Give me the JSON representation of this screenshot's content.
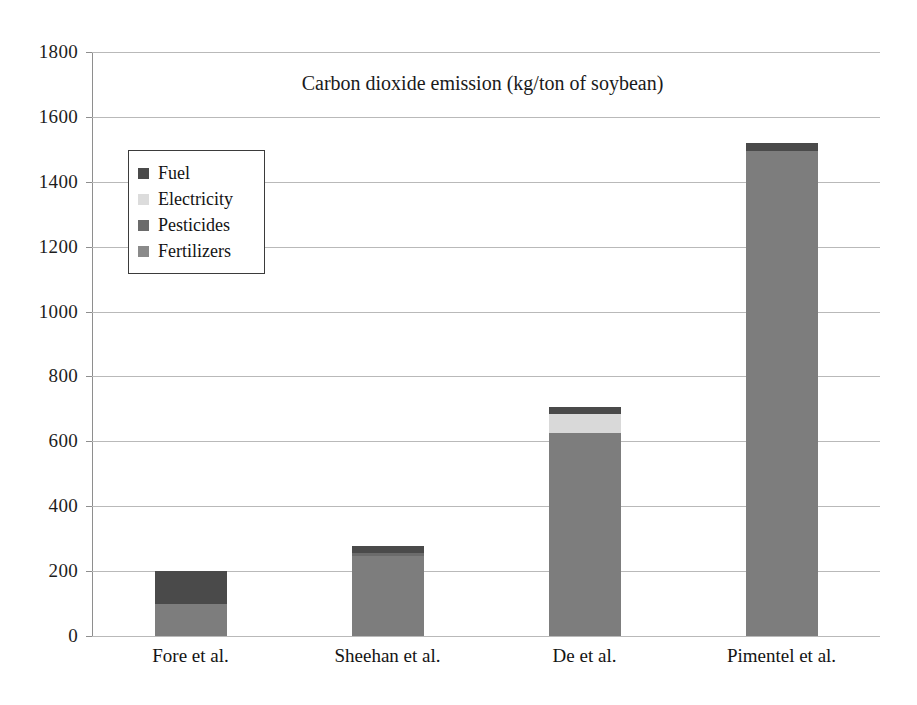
{
  "chart_data": {
    "type": "bar",
    "subtype": "stacked",
    "title": "Carbon dioxide emission (kg/ton of soybean)",
    "xlabel": "",
    "ylabel": "",
    "ylim": [
      0,
      1800
    ],
    "ytick_step": 200,
    "yticks": [
      1800,
      1600,
      1400,
      1200,
      1000,
      800,
      600,
      400,
      200,
      0
    ],
    "ytick_labels": [
      "1800",
      "1600",
      "1400",
      "1200",
      "1000",
      "800",
      "600",
      "400",
      "200",
      "0"
    ],
    "categories": [
      "Fore et al.",
      "Sheehan et al.",
      "De et al.",
      "Pimentel et al."
    ],
    "grid": true,
    "legend_position": "upper-left-inside",
    "series": [
      {
        "name": "Fertilizers",
        "color": "#7d7d7d",
        "values": [
          100,
          248,
          625,
          1495
        ]
      },
      {
        "name": "Pesticides",
        "color": "#6b6b6b",
        "values": [
          0,
          8,
          0,
          0
        ]
      },
      {
        "name": "Electricity",
        "color": "#d9d9d9",
        "values": [
          0,
          0,
          60,
          0
        ]
      },
      {
        "name": "Fuel",
        "color": "#4a4a4a",
        "values": [
          100,
          20,
          20,
          25
        ]
      }
    ],
    "totals": [
      200,
      276,
      705,
      1520
    ],
    "stack_order_bottom_to_top": [
      "Fertilizers",
      "Pesticides",
      "Electricity",
      "Fuel"
    ]
  },
  "legend": {
    "items": [
      {
        "label": "Fuel",
        "color": "#4a4a4a"
      },
      {
        "label": "Electricity",
        "color": "#dcdcdc"
      },
      {
        "label": "Pesticides",
        "color": "#6b6b6b"
      },
      {
        "label": "Fertilizers",
        "color": "#8a8a8a"
      }
    ]
  },
  "colors": {
    "background": "#ffffff",
    "gridline": "#b9b9b9",
    "axis": "#8e8e8e",
    "text": "#1a1a1a",
    "legend_border": "#3b3b3b"
  }
}
